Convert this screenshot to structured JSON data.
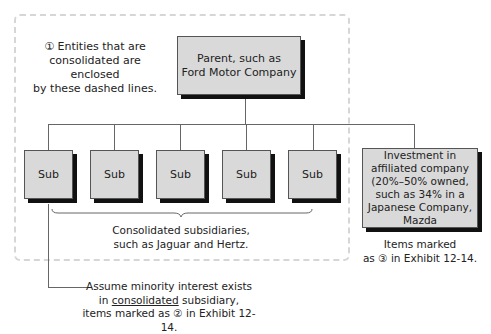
{
  "diagram": {
    "title_fragment": "Company",
    "parent": {
      "label_line1": "Parent, such as",
      "label_line2": "Ford Motor Company"
    },
    "note_dashed": {
      "line1": "① Entities that are",
      "line2": "consolidated are enclosed",
      "line3": "by these dashed lines."
    },
    "subsidiaries": [
      {
        "label": "Sub"
      },
      {
        "label": "Sub"
      },
      {
        "label": "Sub"
      },
      {
        "label": "Sub"
      },
      {
        "label": "Sub"
      }
    ],
    "consolidated_caption": {
      "line1": "Consolidated subsidiaries,",
      "line2": "such as Jaguar and Hertz."
    },
    "affiliated": {
      "line1": "Investment in",
      "line2": "affiliated company",
      "line3": "(20%–50% owned,",
      "line4": "such as 34% in a",
      "line5": "Japanese Company,",
      "line6": "Mazda"
    },
    "affiliated_caption": {
      "line1": "Items marked",
      "line2": "as ③ in Exhibit 12-14."
    },
    "minority_caption": {
      "line1": "Assume minority interest exists",
      "line2_prefix": "in ",
      "line2_underlined": "consolidated",
      "line2_suffix": " subsidiary,",
      "line3": "items marked as ② in Exhibit 12-14."
    },
    "colors": {
      "box_fill": "#d9d9d9",
      "box_shadow": "#111111",
      "dashed_border": "#d6d6d6",
      "connector": "#666666"
    }
  }
}
